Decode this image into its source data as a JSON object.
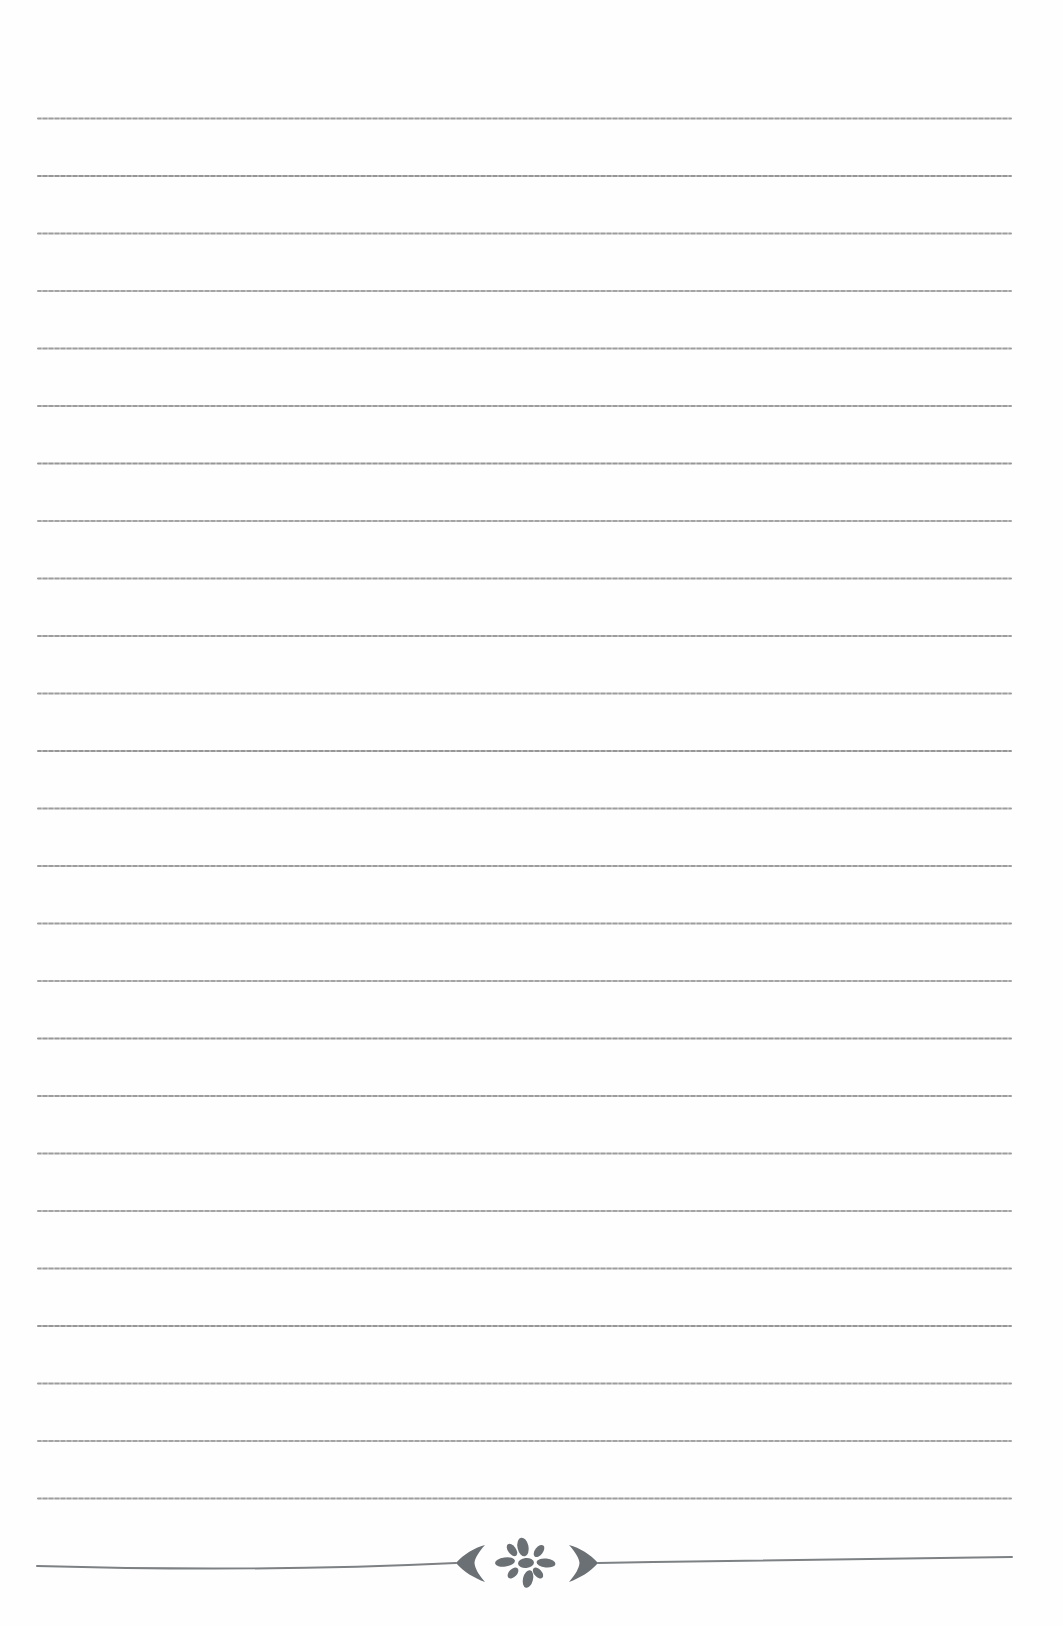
{
  "page": {
    "kind": "blank-ruled-notebook-page",
    "background_color": "#fefefe",
    "width_px": 1063,
    "height_px": 1626,
    "visible_text": ""
  },
  "ruled_lines": {
    "count": 25,
    "color": "#949494",
    "thickness_px": 2,
    "x_start_px": 37,
    "x_end_px": 1012,
    "y_first_px": 117,
    "spacing_px": 57.5
  },
  "divider": {
    "description": "decorative rule interrupted by ornament group",
    "line_color": "#7d8184",
    "ornament_color": "#6b7074",
    "y_center_px": 1563,
    "icons": [
      "left-chevron-icon",
      "flower-ornament-icon",
      "right-chevron-icon"
    ]
  }
}
